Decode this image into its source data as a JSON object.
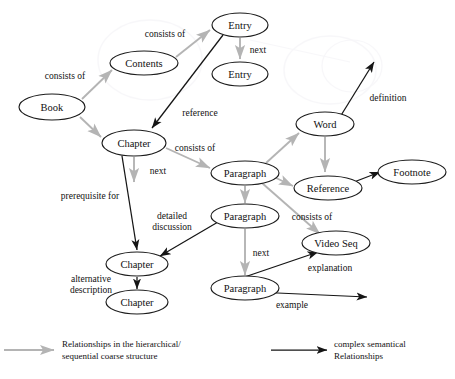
{
  "diagram": {
    "colors": {
      "coarse_edge": "#b4b4b4",
      "semantic_edge": "#151515",
      "node_stroke": "#1c1c1c",
      "background": "#ffffff"
    },
    "nodes": [
      {
        "id": "book",
        "label": "Book",
        "cx": 52,
        "cy": 107,
        "rx": 33,
        "ry": 13
      },
      {
        "id": "contents",
        "label": "Contents",
        "cx": 144,
        "cy": 63,
        "rx": 34,
        "ry": 12
      },
      {
        "id": "entry1",
        "label": "Entry",
        "cx": 240,
        "cy": 25,
        "rx": 28,
        "ry": 12
      },
      {
        "id": "entry2",
        "label": "Entry",
        "cx": 240,
        "cy": 74,
        "rx": 28,
        "ry": 12
      },
      {
        "id": "chapter1",
        "label": "Chapter",
        "cx": 134,
        "cy": 143,
        "rx": 32,
        "ry": 13
      },
      {
        "id": "paragraph1",
        "label": "Paragraph",
        "cx": 245,
        "cy": 173,
        "rx": 34,
        "ry": 12
      },
      {
        "id": "word",
        "label": "Word",
        "cx": 325,
        "cy": 124,
        "rx": 29,
        "ry": 12
      },
      {
        "id": "reference",
        "label": "Reference",
        "cx": 328,
        "cy": 188,
        "rx": 34,
        "ry": 12
      },
      {
        "id": "footnote",
        "label": "Footnote",
        "cx": 412,
        "cy": 172,
        "rx": 34,
        "ry": 12
      },
      {
        "id": "paragraph2",
        "label": "Paragraph",
        "cx": 245,
        "cy": 216,
        "rx": 34,
        "ry": 12
      },
      {
        "id": "videoseq",
        "label": "Video Seq",
        "cx": 336,
        "cy": 243,
        "rx": 34,
        "ry": 12
      },
      {
        "id": "paragraph3",
        "label": "Paragraph",
        "cx": 245,
        "cy": 288,
        "rx": 34,
        "ry": 12
      },
      {
        "id": "chapter2",
        "label": "Chapter",
        "cx": 137,
        "cy": 264,
        "rx": 31,
        "ry": 12
      },
      {
        "id": "chapter3",
        "label": "Chapter",
        "cx": 137,
        "cy": 302,
        "rx": 31,
        "ry": 12
      }
    ],
    "edges": [
      {
        "id": "book-contents",
        "from": "book",
        "to": "contents",
        "kind": "coarse",
        "label": "consists of",
        "lx": 65,
        "ly": 76,
        "path": "M 82 99 L 112 70"
      },
      {
        "id": "contents-entry1",
        "from": "contents",
        "to": "entry1",
        "kind": "coarse",
        "label": "consists of",
        "lx": 165,
        "ly": 34,
        "path": "M 176 57 L 210 30"
      },
      {
        "id": "entry1-entry2",
        "from": "entry1",
        "to": "entry2",
        "kind": "coarse",
        "label": "next",
        "lx": 258,
        "ly": 50,
        "path": "M 240 38 L 240 59"
      },
      {
        "id": "book-chapter1",
        "from": "book",
        "to": "chapter1",
        "kind": "coarse",
        "label": "",
        "lx": 0,
        "ly": 0,
        "path": "M 80 117 L 101 137"
      },
      {
        "id": "entry1-chapter1",
        "from": "entry1",
        "to": "chapter1",
        "kind": "semantic",
        "label": "reference",
        "lx": 200,
        "ly": 113,
        "path": "M 223 35 L 152 128"
      },
      {
        "id": "chapter1-paragraph1",
        "from": "chapter1",
        "to": "paragraph1",
        "kind": "coarse",
        "label": "consists of",
        "lx": 195,
        "ly": 148,
        "path": "M 166 148 L 210 168"
      },
      {
        "id": "chapter1-next",
        "from": "chapter1",
        "to": "",
        "kind": "coarse",
        "label": "next",
        "lx": 158,
        "ly": 171,
        "path": "M 134 157 L 134 182"
      },
      {
        "id": "chapter1-chapter2",
        "from": "chapter1",
        "to": "chapter2",
        "kind": "semantic",
        "label": "prerequisite for",
        "lx": 90,
        "ly": 196,
        "path": "M 122 156 L 137 250"
      },
      {
        "id": "paragraph1-word",
        "from": "paragraph1",
        "to": "word",
        "kind": "coarse",
        "label": "",
        "lx": 0,
        "ly": 0,
        "path": "M 266 163 L 299 133"
      },
      {
        "id": "word-reference",
        "from": "word",
        "to": "reference",
        "kind": "coarse",
        "label": "",
        "lx": 0,
        "ly": 0,
        "path": "M 325 137 L 325 172"
      },
      {
        "id": "word-definition",
        "from": "word",
        "to": "",
        "kind": "semantic",
        "label": "definition",
        "lx": 388,
        "ly": 98,
        "path": "M 340 117 L 374 62"
      },
      {
        "id": "paragraph1-reference",
        "from": "paragraph1",
        "to": "reference",
        "kind": "coarse",
        "label": "",
        "lx": 0,
        "ly": 0,
        "path": "M 274 177 L 293 186"
      },
      {
        "id": "reference-footnote",
        "from": "reference",
        "to": "footnote",
        "kind": "semantic",
        "label": "",
        "lx": 0,
        "ly": 0,
        "path": "M 354 182 L 380 172"
      },
      {
        "id": "paragraph1-paragraph2",
        "from": "paragraph1",
        "to": "paragraph2",
        "kind": "coarse",
        "label": "",
        "lx": 0,
        "ly": 0,
        "path": "M 245 186 L 245 203"
      },
      {
        "id": "paragraph1-videoseq",
        "from": "paragraph1",
        "to": "videoseq",
        "kind": "coarse",
        "label": "consists of",
        "lx": 312,
        "ly": 217,
        "path": "M 262 183 L 320 234"
      },
      {
        "id": "paragraph2-paragraph3",
        "from": "paragraph2",
        "to": "paragraph3",
        "kind": "coarse",
        "label": "next",
        "lx": 261,
        "ly": 253,
        "path": "M 245 229 L 245 275"
      },
      {
        "id": "paragraph2-chapter2",
        "from": "paragraph2",
        "to": "chapter2",
        "kind": "semantic",
        "label": "detailed discussion",
        "lx": 172,
        "ly": 221,
        "path": "M 218 222 L 160 256"
      },
      {
        "id": "paragraph3-videoseq",
        "from": "paragraph3",
        "to": "videoseq",
        "kind": "semantic",
        "label": "explanation",
        "lx": 330,
        "ly": 268,
        "path": "M 224 284 L 318 252"
      },
      {
        "id": "paragraph3-example",
        "from": "paragraph3",
        "to": "",
        "kind": "semantic",
        "label": "example",
        "lx": 292,
        "ly": 305,
        "path": "M 255 292 L 367 297"
      },
      {
        "id": "chapter2-chapter3",
        "from": "chapter2",
        "to": "chapter3",
        "kind": "semantic",
        "label": "alternative description",
        "lx": 91,
        "ly": 284,
        "path": "M 137 277 L 137 289"
      }
    ],
    "edge_label_lines": {
      "detailed_discussion": [
        "detailed",
        "discussion"
      ],
      "alternative_description": [
        "alternative",
        "description"
      ]
    },
    "legend": [
      {
        "id": "legend-coarse",
        "kind": "coarse",
        "lines": [
          "Relationships in the hierarchical/",
          "sequential coarse structure"
        ],
        "arrow": {
          "x1": 4,
          "y1": 350,
          "x2": 54,
          "y2": 350
        },
        "text_x": 62,
        "text_y": 344
      },
      {
        "id": "legend-semantic",
        "kind": "semantic",
        "lines": [
          "complex semantical",
          "Relationships"
        ],
        "arrow": {
          "x1": 271,
          "y1": 350,
          "x2": 327,
          "y2": 350
        },
        "text_x": 334,
        "text_y": 344
      }
    ]
  }
}
